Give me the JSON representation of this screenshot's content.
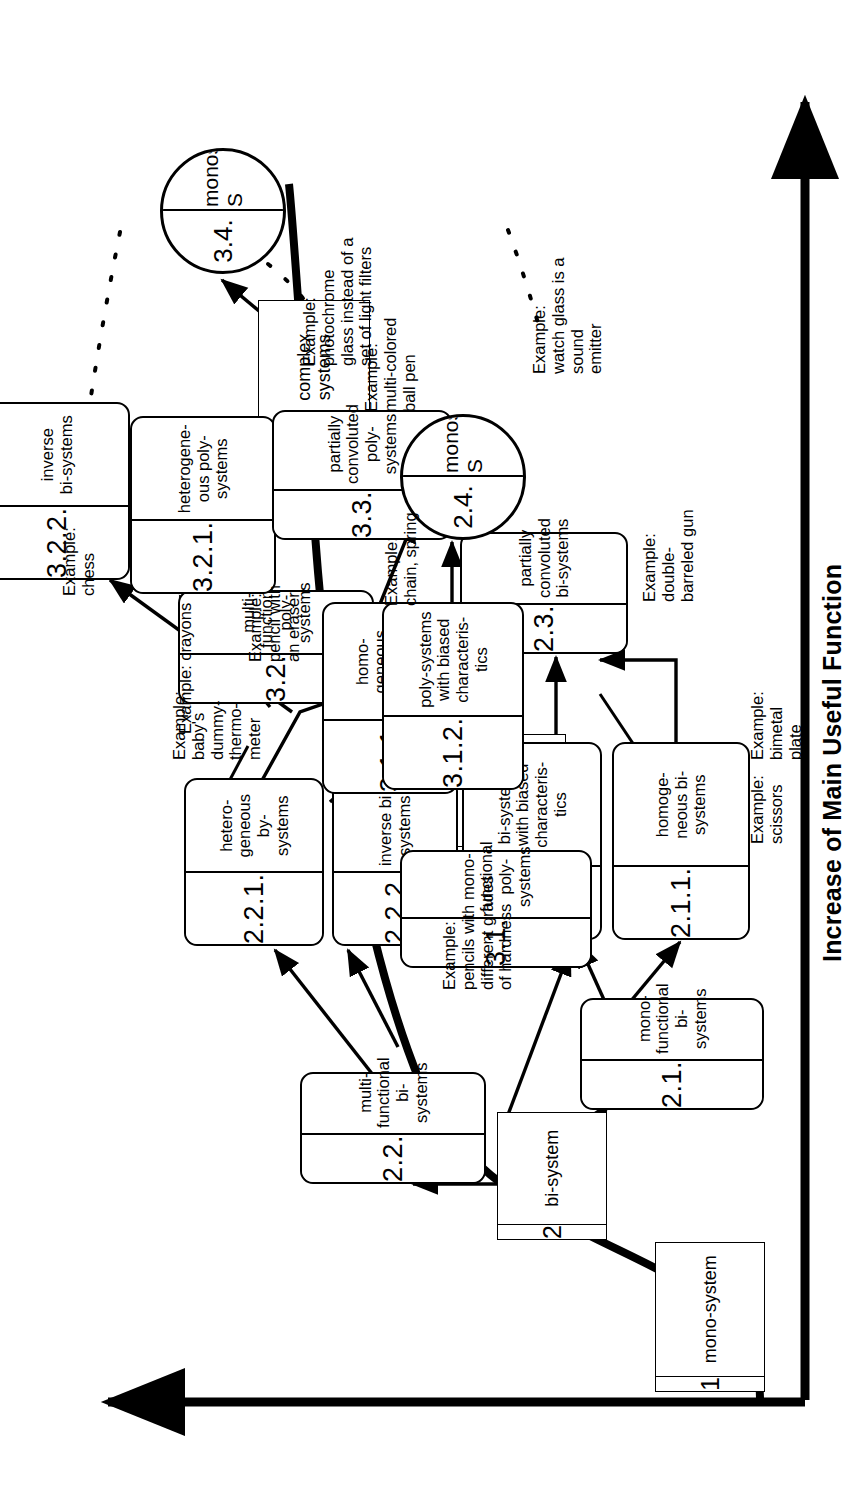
{
  "diagram": {
    "axis_label": "Increase of Main Useful Function",
    "stages": [
      {
        "id": "stage-1",
        "num": "1",
        "label": "mono-system"
      },
      {
        "id": "stage-2",
        "num": "2",
        "label": "bi-system"
      },
      {
        "id": "stage-3",
        "num": "3",
        "label": "poly-system"
      },
      {
        "id": "stage-4",
        "num": "4",
        "label": "complex\nsystems"
      }
    ],
    "nodes": [
      {
        "id": "n-2-1",
        "num": "2.1.",
        "label": "mono-\nfunctional\nbi-systems"
      },
      {
        "id": "n-2-2",
        "num": "2.2.",
        "label": "multi-\nfunctional\nbi-systems"
      },
      {
        "id": "n-2-1-1",
        "num": "2.1.1.",
        "label": "homoge-\nneous bi-\nsystems"
      },
      {
        "id": "n-2-1-2",
        "num": "2.1.2.",
        "label": "bi-systems\nwith biased\ncharacteris-\ntics"
      },
      {
        "id": "n-2-2-1",
        "num": "2.2.1.",
        "label": "hetero-\ngeneous\nby-systems"
      },
      {
        "id": "n-2-2-2",
        "num": "2.2.2.",
        "label": "inverse bi -\nsystems"
      },
      {
        "id": "n-2-3",
        "num": "2.3.",
        "label": "partially\nconvoluted\nbi-systems"
      },
      {
        "id": "n-3-1",
        "num": "3.1.",
        "label": "mono-\nfunctional\npoly-systems"
      },
      {
        "id": "n-3-2",
        "num": "3.2.",
        "label": "multi-\nfunctional\npoly-systems"
      },
      {
        "id": "n-3-1-1",
        "num": "3.1.1.",
        "label": "homo-\ngeneous\npoly-\nsystems"
      },
      {
        "id": "n-3-1-2",
        "num": "3.1.2.",
        "label": "poly-systems\nwith biased\ncharacteris-\ntics"
      },
      {
        "id": "n-3-2-1",
        "num": "3.2.1.",
        "label": "heterogene-\nous poly-\nsystems"
      },
      {
        "id": "n-3-2-2",
        "num": "3.2.2.",
        "label": "inverse\nbi-systems"
      },
      {
        "id": "n-3-3",
        "num": "3.3.",
        "label": "partially\nconvoluted\npoly-systems"
      }
    ],
    "circles": [
      {
        "id": "c-2-4",
        "num": "2.4.",
        "label": "monos-S"
      },
      {
        "id": "c-3-4",
        "num": "3.4.",
        "label": "monos-S"
      }
    ],
    "notes": [
      {
        "id": "note-scissors",
        "text": "Example:\nscissors"
      },
      {
        "id": "note-bimetal",
        "text": "Example:\nbimetal\nplate"
      },
      {
        "id": "note-thermometer",
        "text": "Example:\nbaby's\ndummy-\nthermo-\nmeter"
      },
      {
        "id": "note-pencil",
        "text": "Example:\npencil with\nan eraser"
      },
      {
        "id": "note-gun",
        "text": "Example:\ndouble-\nbarreled gun"
      },
      {
        "id": "note-watchglass",
        "text": "Example:\nwatch glass is a\nsound\nemitter"
      },
      {
        "id": "note-chain",
        "text": "Example:\nchain, spring"
      },
      {
        "id": "note-hardness",
        "text": "Example:\npencils with\ndifferent grades\nof hardness"
      },
      {
        "id": "note-crayons",
        "text": "Example: crayons"
      },
      {
        "id": "note-chess",
        "text": "Example:\nchess"
      },
      {
        "id": "note-ballpen",
        "text": "Example:\nmulti-colored\nball pen"
      },
      {
        "id": "note-photochrome",
        "text": "Example:\nphotochrome\nglass instead of a\nset of light filters"
      }
    ]
  }
}
